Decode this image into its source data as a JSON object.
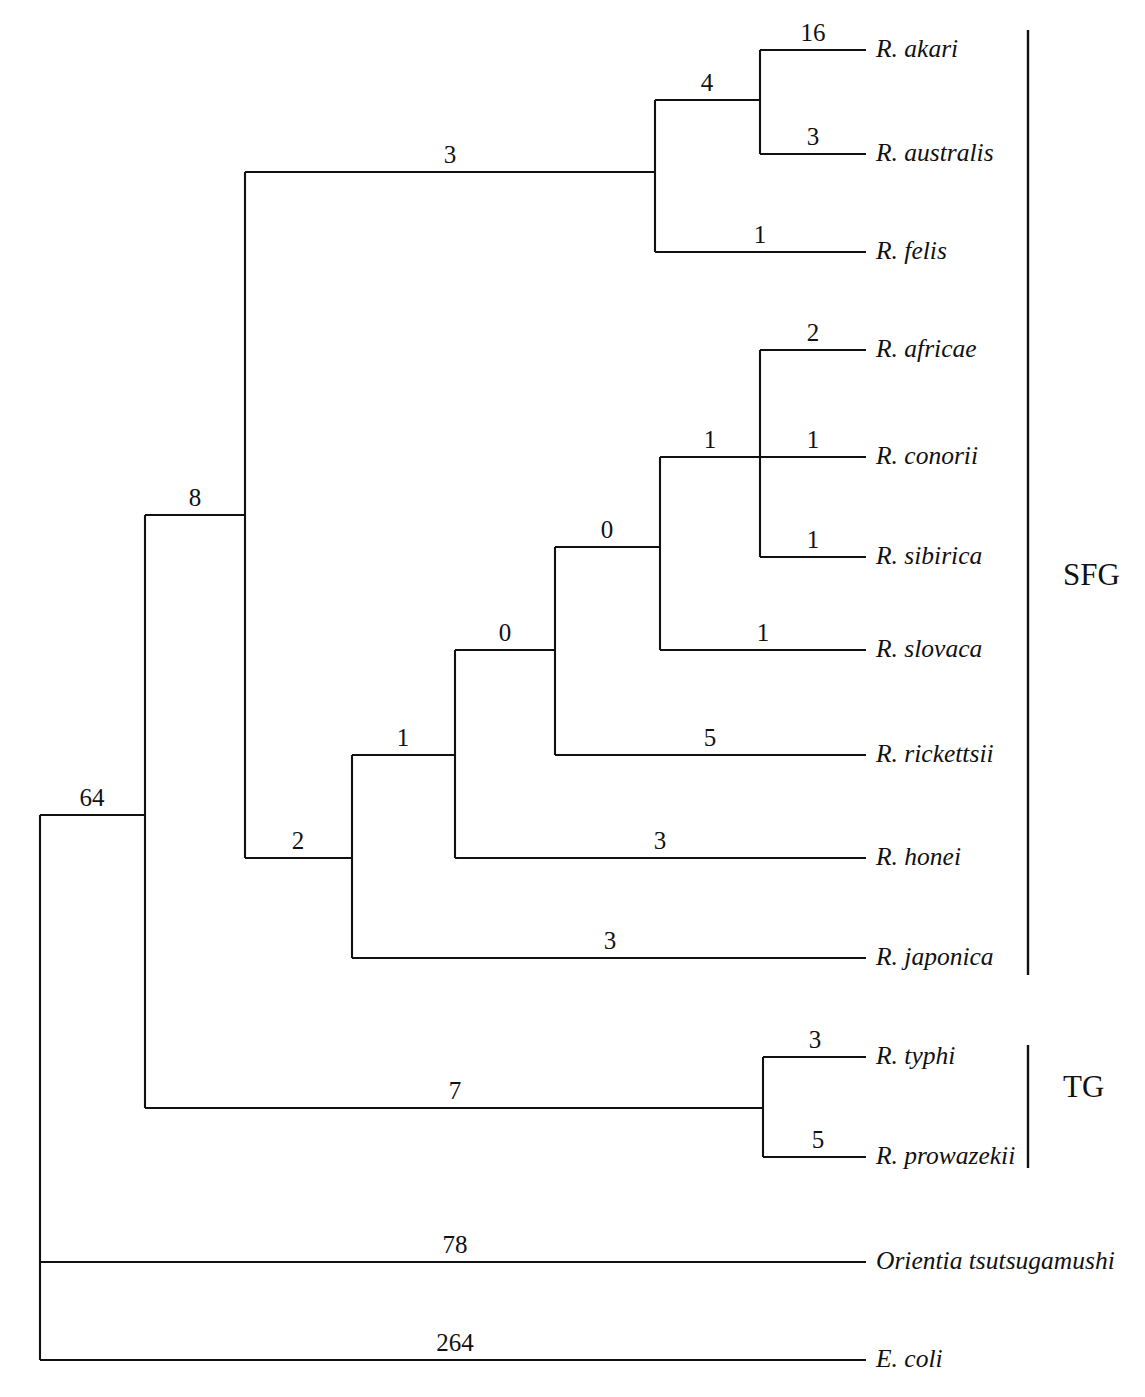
{
  "figure": {
    "type": "phylogenetic-cladogram",
    "orientation": "left-to-right",
    "background_color": "#ffffff",
    "line_color": "#111111"
  },
  "chart_data": {
    "type": "tree",
    "title": "",
    "taxa": [
      {
        "name": "R. akari",
        "y": 50,
        "group": "SFG",
        "branch_length": 16
      },
      {
        "name": "R. australis",
        "y": 154,
        "group": "SFG",
        "branch_length": 3
      },
      {
        "name": "R. felis",
        "y": 252,
        "group": "SFG",
        "branch_length": 1
      },
      {
        "name": "R. africae",
        "y": 350,
        "group": "SFG",
        "branch_length": 2
      },
      {
        "name": "R. conorii",
        "y": 457,
        "group": "SFG",
        "branch_length": 1
      },
      {
        "name": "R. sibirica",
        "y": 557,
        "group": "SFG",
        "branch_length": 1
      },
      {
        "name": "R. slovaca",
        "y": 650,
        "group": "SFG",
        "branch_length": 1
      },
      {
        "name": "R. rickettsii",
        "y": 755,
        "group": "SFG",
        "branch_length": 5
      },
      {
        "name": "R. honei",
        "y": 858,
        "group": "SFG",
        "branch_length": 3
      },
      {
        "name": "R. japonica",
        "y": 958,
        "group": "SFG",
        "branch_length": 3
      },
      {
        "name": "R. typhi",
        "y": 1057,
        "group": "TG",
        "branch_length": 3
      },
      {
        "name": "R. prowazekii",
        "y": 1157,
        "group": "TG",
        "branch_length": 5
      },
      {
        "name": "Orientia tsutsugamushi",
        "y": 1262,
        "group": "",
        "branch_length": 78
      },
      {
        "name": "E. coli",
        "y": 1360,
        "group": "",
        "branch_length": 264
      }
    ],
    "internal_branch_lengths": [
      64,
      8,
      3,
      4,
      2,
      1,
      0,
      0,
      1,
      7
    ],
    "groups": [
      {
        "label": "SFG",
        "top": 30,
        "bottom": 975
      },
      {
        "label": "TG",
        "top": 1045,
        "bottom": 1168
      }
    ]
  },
  "tree": {
    "tip_x": 866,
    "label_x": 876,
    "bracket_x": 1028,
    "group_label_x": 1063,
    "taxa": [
      {
        "label": "R. akari",
        "y": 50,
        "branch_x": 760,
        "length": "16",
        "length_x": 813
      },
      {
        "label": "R. australis",
        "y": 154,
        "branch_x": 760,
        "length": "3",
        "length_x": 813
      },
      {
        "label": "R. felis",
        "y": 252,
        "branch_x": 655,
        "length": "1",
        "length_x": 760
      },
      {
        "label": "R. africae",
        "y": 350,
        "branch_x": 760,
        "length": "2",
        "length_x": 813
      },
      {
        "label": "R. conorii",
        "y": 457,
        "branch_x": 760,
        "length": "1",
        "length_x": 813
      },
      {
        "label": "R. sibirica",
        "y": 557,
        "branch_x": 760,
        "length": "1",
        "length_x": 813
      },
      {
        "label": "R. slovaca",
        "y": 650,
        "branch_x": 660,
        "length": "1",
        "length_x": 763
      },
      {
        "label": "R. rickettsii",
        "y": 755,
        "branch_x": 555,
        "length": "5",
        "length_x": 710
      },
      {
        "label": "R. honei",
        "y": 858,
        "branch_x": 455,
        "length": "3",
        "length_x": 660
      },
      {
        "label": "R. japonica",
        "y": 958,
        "branch_x": 352,
        "length": "3",
        "length_x": 610
      },
      {
        "label": "R. typhi",
        "y": 1057,
        "branch_x": 763,
        "length": "3",
        "length_x": 815
      },
      {
        "label": "R. prowazekii",
        "y": 1157,
        "branch_x": 763,
        "length": "5",
        "length_x": 818
      },
      {
        "label": "Orientia tsutsugamushi",
        "y": 1262,
        "branch_x": 40,
        "length": "78",
        "length_x": 455
      },
      {
        "label": "E. coli",
        "y": 1360,
        "branch_x": 40,
        "length": "264",
        "length_x": 455
      }
    ],
    "internal": [
      {
        "name": "root-to-node64",
        "x1": 40,
        "x2": 145,
        "y": 815,
        "length": "64",
        "length_x": 92
      },
      {
        "name": "node64-to-node8",
        "x1": 145,
        "x2": 245,
        "y": 515,
        "length": "8",
        "length_x": 195
      },
      {
        "name": "node8-to-akari-clade",
        "x1": 245,
        "x2": 655,
        "y": 172,
        "length": "3",
        "length_x": 450
      },
      {
        "name": "felis-clade-to-pair",
        "x1": 655,
        "x2": 760,
        "y": 100,
        "length": "4",
        "length_x": 707
      },
      {
        "name": "node8-to-node2",
        "x1": 245,
        "x2": 352,
        "y": 858,
        "length": "2",
        "length_x": 298
      },
      {
        "name": "node2-to-node1",
        "x1": 352,
        "x2": 455,
        "y": 755,
        "length": "1",
        "length_x": 403
      },
      {
        "name": "node1-to-node0a",
        "x1": 455,
        "x2": 555,
        "y": 650,
        "length": "0",
        "length_x": 505
      },
      {
        "name": "node0a-to-node0b",
        "x1": 555,
        "x2": 660,
        "y": 547,
        "length": "0",
        "length_x": 607
      },
      {
        "name": "node0b-to-trifurcation",
        "x1": 660,
        "x2": 760,
        "y": 457,
        "length": "1",
        "length_x": 710
      },
      {
        "name": "node64-to-tg",
        "x1": 145,
        "x2": 763,
        "y": 1108,
        "length": "7",
        "length_x": 455
      }
    ],
    "verticals": [
      {
        "name": "root-vertical",
        "x": 40,
        "y1": 815,
        "y2": 1360
      },
      {
        "name": "node64-vertical",
        "x": 145,
        "y1": 515,
        "y2": 1108
      },
      {
        "name": "node8-vertical",
        "x": 245,
        "y1": 172,
        "y2": 858
      },
      {
        "name": "node2-vertical",
        "x": 352,
        "y1": 755,
        "y2": 958
      },
      {
        "name": "node1-vertical",
        "x": 455,
        "y1": 650,
        "y2": 858
      },
      {
        "name": "node0a-vertical",
        "x": 555,
        "y1": 547,
        "y2": 755
      },
      {
        "name": "node0b-vertical",
        "x": 660,
        "y1": 457,
        "y2": 650
      },
      {
        "name": "akari-clade-vertical",
        "x": 655,
        "y1": 100,
        "y2": 252
      },
      {
        "name": "akari-pair-vertical",
        "x": 760,
        "y1": 50,
        "y2": 154
      },
      {
        "name": "spotted-trifurcation-vertical",
        "x": 760,
        "y1": 350,
        "y2": 557
      },
      {
        "name": "typhus-vertical",
        "x": 763,
        "y1": 1057,
        "y2": 1157
      }
    ],
    "groups": [
      {
        "label": "SFG",
        "x": 1028,
        "y1": 30,
        "y2": 975,
        "label_y": 578
      },
      {
        "label": "TG",
        "x": 1028,
        "y1": 1045,
        "y2": 1168,
        "label_y": 1090
      }
    ]
  }
}
